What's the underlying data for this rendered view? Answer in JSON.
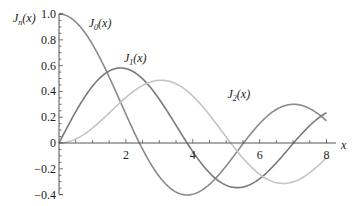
{
  "chart_data": {
    "type": "line",
    "title": "",
    "xlabel": "x",
    "ylabel": "J_n(x)",
    "xlim": [
      0,
      8
    ],
    "ylim": [
      -0.4,
      1.0
    ],
    "grid": false,
    "x_ticks": [
      "2",
      "4",
      "6",
      "8"
    ],
    "y_ticks": [
      "1.0",
      "0.8",
      "0.6",
      "0.4",
      "0.2",
      "0",
      "-0.2",
      "-0.4"
    ],
    "x": [
      0,
      0.5,
      1,
      1.5,
      2,
      2.5,
      3,
      3.5,
      4,
      4.5,
      5,
      5.5,
      6,
      6.5,
      7,
      7.5,
      8
    ],
    "series": [
      {
        "name": "J0(x)",
        "label_main": "J",
        "label_sub": "0",
        "color": "#8a8a8a",
        "values": [
          1.0,
          0.938,
          0.765,
          0.512,
          0.224,
          -0.048,
          -0.26,
          -0.38,
          -0.397,
          -0.321,
          -0.178,
          -0.007,
          0.151,
          0.26,
          0.3,
          0.266,
          0.172
        ]
      },
      {
        "name": "J1(x)",
        "label_main": "J",
        "label_sub": "1",
        "color": "#7a7a7a",
        "values": [
          0.0,
          0.242,
          0.44,
          0.558,
          0.577,
          0.497,
          0.339,
          0.137,
          -0.066,
          -0.231,
          -0.328,
          -0.341,
          -0.277,
          -0.154,
          -0.005,
          0.135,
          0.235
        ]
      },
      {
        "name": "J2(x)",
        "label_main": "J",
        "label_sub": "2",
        "color": "#c4c4c4",
        "values": [
          0.0,
          0.031,
          0.115,
          0.232,
          0.353,
          0.446,
          0.486,
          0.459,
          0.364,
          0.218,
          0.047,
          -0.117,
          -0.243,
          -0.307,
          -0.301,
          -0.23,
          -0.113
        ]
      }
    ],
    "annotations": [
      {
        "text": "J0(x)",
        "x": 0.95,
        "y": 0.93
      },
      {
        "text": "J1(x)",
        "x": 2.0,
        "y": 0.66
      },
      {
        "text": "J2(x)",
        "x": 5.1,
        "y": 0.38
      }
    ]
  },
  "axis": {
    "y_title_main": "J",
    "y_title_sub": "n",
    "y_title_arg": "(x)",
    "x_title": "x"
  }
}
